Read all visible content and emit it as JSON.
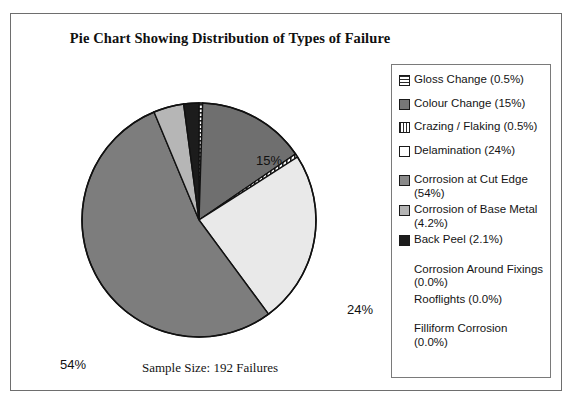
{
  "chart_data": {
    "type": "pie",
    "title": "Pie Chart Showing Distribution of Types of Failure",
    "caption": "Sample Size: 192 Failures",
    "sample_size": 192,
    "categories": [
      "Gloss Change",
      "Colour Change",
      "Crazing / Flaking",
      "Delamination",
      "Corrosion at Cut Edge",
      "Corrosion of Base Metal",
      "Back Peel",
      "Corrosion Around Fixings",
      "Rooflights",
      "Filliform Corrosion"
    ],
    "values": [
      0.5,
      15,
      0.5,
      24,
      54,
      4.2,
      2.1,
      0.0,
      0.0,
      0.0
    ],
    "value_labels": [
      "0.5%",
      "15%",
      "0.5%",
      "24%",
      "54%",
      "4.2%",
      "2.1%",
      "0.0%",
      "0.0%",
      "0.0%"
    ],
    "slice_fills": [
      "horizontal-stripe",
      "dark-gray",
      "vertical-stripe",
      "very-light-gray",
      "medium-gray",
      "light-gray",
      "black"
    ],
    "callout_labels": [
      "15%",
      "24%",
      "54%"
    ],
    "legend_position": "right",
    "grid": false
  },
  "title": "Pie Chart Showing Distribution of Types of Failure",
  "caption": "Sample Size: 192 Failures",
  "callouts": {
    "colour_change": "15%",
    "delamination": "24%",
    "corrosion_cut_edge": "54%"
  },
  "legend": {
    "items": [
      {
        "label": "Gloss Change (0.5%)",
        "swatch": "horizontal-stripe",
        "has_key": true
      },
      {
        "label": "Colour Change  (15%)",
        "swatch": "dark-gray",
        "has_key": true
      },
      {
        "label": "Crazing / Flaking  (0.5%)",
        "swatch": "vertical-stripe",
        "has_key": true
      },
      {
        "label": "Delamination  (24%)",
        "swatch": "white",
        "has_key": true
      },
      {
        "label": "Corrosion at Cut Edge (54%)",
        "swatch": "medium-gray",
        "has_key": true
      },
      {
        "label": "Corrosion of Base Metal (4.2%)",
        "swatch": "light-gray",
        "has_key": true
      },
      {
        "label": "Back Peel  (2.1%)",
        "swatch": "black",
        "has_key": true
      },
      {
        "label": "Corrosion Around Fixings (0.0%)",
        "swatch": "none",
        "has_key": false
      },
      {
        "label": "Rooflights  (0.0%)",
        "swatch": "none",
        "has_key": false
      },
      {
        "label": "Filliform Corrosion  (0.0%)",
        "swatch": "none",
        "has_key": false
      }
    ]
  },
  "colors": {
    "dark_gray": "#777777",
    "medium_gray": "#8a8a8a",
    "light_gray": "#b4b4b4",
    "very_light_gray": "#e8e8e8",
    "black": "#1c1c1c",
    "outline": "#111111"
  }
}
